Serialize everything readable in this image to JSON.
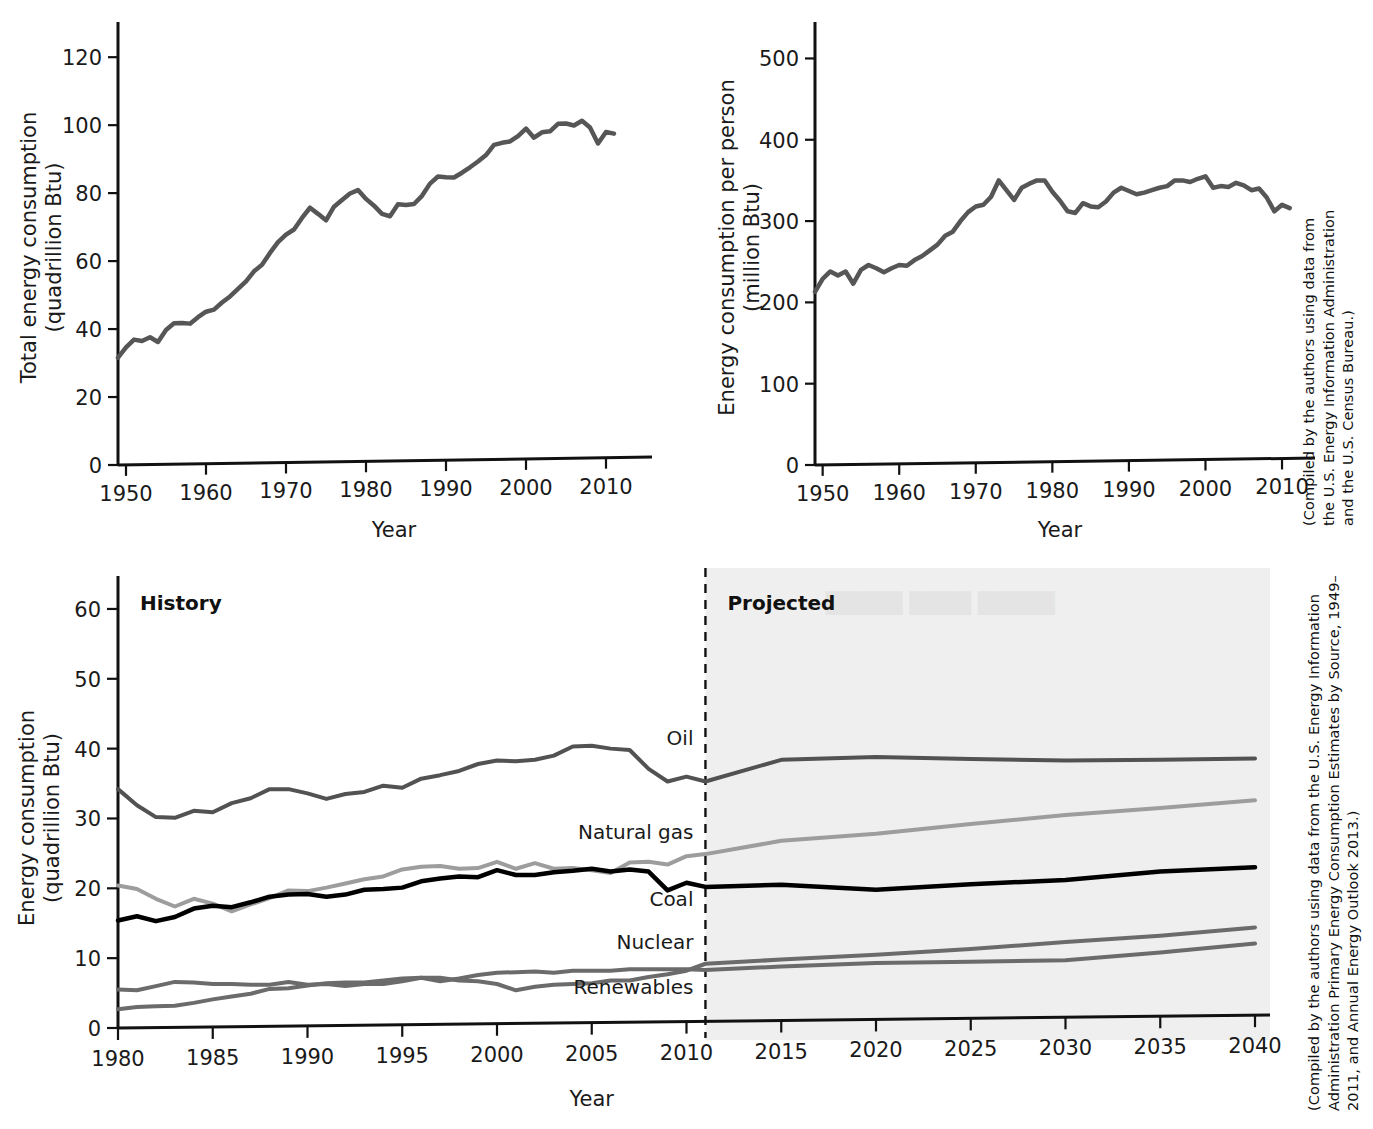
{
  "figure": {
    "background": "#ffffff",
    "line_color_dark": "#4a4a4a",
    "accent_black": "#000000"
  },
  "captions": {
    "top_right": "(Compiled by the authors using data from the U.S. Energy Information Administration and the U.S. Census Bureau.)",
    "bottom_right": "(Compiled by the authors using data from the U.S. Energy Information Administration Primary Energy Consumption Estimates by Source, 1949–2011, and Annual Energy Outlook 2013.)"
  },
  "chart_data": [
    {
      "id": "total-energy-consumption",
      "type": "line",
      "title": "",
      "xlabel": "Year",
      "ylabel": "Total energy consumption\n(quadrillion Btu)",
      "ylabel_line1": "Total energy consumption",
      "ylabel_line2": "(quadrillion Btu)",
      "xlim": [
        1949,
        2013
      ],
      "ylim": [
        0,
        128
      ],
      "xticks": [
        1950,
        1960,
        1970,
        1980,
        1990,
        2000,
        2010
      ],
      "yticks": [
        0,
        20,
        40,
        60,
        80,
        100,
        120
      ],
      "grid": false,
      "legend": "none",
      "line_color": "#565656",
      "line_width": 4.5,
      "x": [
        1949,
        1950,
        1951,
        1952,
        1953,
        1954,
        1955,
        1956,
        1957,
        1958,
        1959,
        1960,
        1961,
        1962,
        1963,
        1964,
        1965,
        1966,
        1967,
        1968,
        1969,
        1970,
        1971,
        1972,
        1973,
        1974,
        1975,
        1976,
        1977,
        1978,
        1979,
        1980,
        1981,
        1982,
        1983,
        1984,
        1985,
        1986,
        1987,
        1988,
        1989,
        1990,
        1991,
        1992,
        1993,
        1994,
        1995,
        1996,
        1997,
        1998,
        1999,
        2000,
        2001,
        2002,
        2003,
        2004,
        2005,
        2006,
        2007,
        2008,
        2009,
        2010,
        2011
      ],
      "values": [
        31.6,
        34.6,
        36.9,
        36.5,
        37.6,
        36.2,
        39.7,
        41.7,
        41.8,
        41.6,
        43.5,
        45.1,
        45.7,
        47.8,
        49.6,
        51.8,
        54.0,
        57.0,
        58.9,
        62.4,
        65.6,
        67.8,
        69.3,
        72.7,
        75.7,
        73.9,
        72.0,
        76.0,
        78.0,
        79.9,
        80.9,
        78.3,
        76.3,
        73.9,
        73.2,
        76.7,
        76.5,
        76.8,
        79.2,
        82.8,
        84.9,
        84.7,
        84.6,
        86.0,
        87.6,
        89.3,
        91.2,
        94.2,
        94.8,
        95.2,
        96.8,
        99.0,
        96.3,
        97.9,
        98.2,
        100.4,
        100.5,
        99.9,
        101.3,
        99.3,
        94.6,
        98.0,
        97.5
      ]
    },
    {
      "id": "energy-consumption-per-person",
      "type": "line",
      "title": "",
      "xlabel": "Year",
      "ylabel": "Energy consumption per person\n(million Btu)",
      "ylabel_line1": "Energy consumption per person",
      "ylabel_line2": "(million Btu)",
      "xlim": [
        1949,
        2013
      ],
      "ylim": [
        0,
        535
      ],
      "xticks": [
        1950,
        1960,
        1970,
        1980,
        1990,
        2000,
        2010
      ],
      "yticks": [
        0,
        100,
        200,
        300,
        400,
        500
      ],
      "grid": false,
      "legend": "none",
      "line_color": "#565656",
      "line_width": 4.5,
      "x": [
        1949,
        1950,
        1951,
        1952,
        1953,
        1954,
        1955,
        1956,
        1957,
        1958,
        1959,
        1960,
        1961,
        1962,
        1963,
        1964,
        1965,
        1966,
        1967,
        1968,
        1969,
        1970,
        1971,
        1972,
        1973,
        1974,
        1975,
        1976,
        1977,
        1978,
        1979,
        1980,
        1981,
        1982,
        1983,
        1984,
        1985,
        1986,
        1987,
        1988,
        1989,
        1990,
        1991,
        1992,
        1993,
        1994,
        1995,
        1996,
        1997,
        1998,
        1999,
        2000,
        2001,
        2002,
        2003,
        2004,
        2005,
        2006,
        2007,
        2008,
        2009,
        2010,
        2011
      ],
      "values": [
        213,
        229,
        238,
        233,
        238,
        223,
        240,
        246,
        242,
        237,
        242,
        246,
        245,
        252,
        257,
        264,
        271,
        282,
        287,
        300,
        311,
        318,
        320,
        330,
        350,
        338,
        326,
        341,
        346,
        350,
        350,
        336,
        325,
        312,
        310,
        322,
        318,
        317,
        324,
        335,
        341,
        337,
        333,
        335,
        338,
        341,
        343,
        350,
        350,
        348,
        352,
        355,
        341,
        343,
        342,
        347,
        344,
        338,
        340,
        329,
        312,
        320,
        316
      ]
    },
    {
      "id": "energy-consumption-by-source",
      "type": "line",
      "title": "",
      "xlabel": "Year",
      "ylabel": "Energy consumption\n(quadrillion Btu)",
      "ylabel_line1": "Energy consumption",
      "ylabel_line2": "(quadrillion Btu)",
      "xlim": [
        1980,
        2040
      ],
      "ylim": [
        0,
        63
      ],
      "xticks": [
        1980,
        1985,
        1990,
        1995,
        2000,
        2005,
        2010,
        2015,
        2020,
        2025,
        2030,
        2035,
        2040
      ],
      "yticks": [
        0,
        10,
        20,
        30,
        40,
        50,
        60
      ],
      "grid": false,
      "legend": "inline-right",
      "history_label": "History",
      "projected_label": "Projected",
      "divider_year": 2011,
      "projected_fill": "#efefef",
      "series": [
        {
          "name": "Oil",
          "color": "#525252",
          "width": 4,
          "label_x": 2011,
          "label_y": 41.5,
          "x": [
            1980,
            1981,
            1982,
            1983,
            1984,
            1985,
            1986,
            1987,
            1988,
            1989,
            1990,
            1991,
            1992,
            1993,
            1994,
            1995,
            1996,
            1997,
            1998,
            1999,
            2000,
            2001,
            2002,
            2003,
            2004,
            2005,
            2006,
            2007,
            2008,
            2009,
            2010,
            2011,
            2015,
            2020,
            2025,
            2030,
            2035,
            2040
          ],
          "values": [
            34.2,
            31.9,
            30.2,
            30.1,
            31.1,
            30.9,
            32.2,
            32.9,
            34.2,
            34.2,
            33.6,
            32.8,
            33.5,
            33.8,
            34.7,
            34.4,
            35.7,
            36.2,
            36.8,
            37.8,
            38.3,
            38.2,
            38.4,
            39.0,
            40.3,
            40.4,
            40.0,
            39.8,
            37.1,
            35.3,
            36.0,
            35.3,
            38.4,
            38.8,
            38.5,
            38.3,
            38.4,
            38.6
          ]
        },
        {
          "name": "Natural gas",
          "color": "#9d9d9d",
          "width": 4,
          "label_x": 2011,
          "label_y": 28.0,
          "x": [
            1980,
            1981,
            1982,
            1983,
            1984,
            1985,
            1986,
            1987,
            1988,
            1989,
            1990,
            1991,
            1992,
            1993,
            1994,
            1995,
            1996,
            1997,
            1998,
            1999,
            2000,
            2001,
            2002,
            2003,
            2004,
            2005,
            2006,
            2007,
            2008,
            2009,
            2010,
            2011,
            2015,
            2020,
            2025,
            2030,
            2035,
            2040
          ],
          "values": [
            20.4,
            19.9,
            18.5,
            17.4,
            18.5,
            17.8,
            16.7,
            17.7,
            18.6,
            19.7,
            19.6,
            20.1,
            20.7,
            21.3,
            21.7,
            22.7,
            23.1,
            23.2,
            22.8,
            22.9,
            23.8,
            22.8,
            23.6,
            22.8,
            22.9,
            22.6,
            22.2,
            23.7,
            23.8,
            23.4,
            24.6,
            24.9,
            26.8,
            27.8,
            29.2,
            30.5,
            31.5,
            32.6
          ]
        },
        {
          "name": "Coal",
          "color": "#000000",
          "width": 4.5,
          "label_x": 2011,
          "label_y": 18.5,
          "x": [
            1980,
            1981,
            1982,
            1983,
            1984,
            1985,
            1986,
            1987,
            1988,
            1989,
            1990,
            1991,
            1992,
            1993,
            1994,
            1995,
            1996,
            1997,
            1998,
            1999,
            2000,
            2001,
            2002,
            2003,
            2004,
            2005,
            2006,
            2007,
            2008,
            2009,
            2010,
            2011,
            2015,
            2020,
            2025,
            2030,
            2035,
            2040
          ],
          "values": [
            15.4,
            16.0,
            15.3,
            15.9,
            17.1,
            17.5,
            17.3,
            18.0,
            18.8,
            19.1,
            19.2,
            18.8,
            19.1,
            19.8,
            19.9,
            20.1,
            21.0,
            21.4,
            21.7,
            21.6,
            22.6,
            21.9,
            21.9,
            22.3,
            22.5,
            22.8,
            22.4,
            22.7,
            22.4,
            19.7,
            20.8,
            20.2,
            20.5,
            19.8,
            20.6,
            21.2,
            22.4,
            23.0
          ]
        },
        {
          "name": "Nuclear",
          "color": "#6b6b6b",
          "width": 4,
          "label_x": 2011,
          "label_y": 12.3,
          "x": [
            1980,
            1981,
            1982,
            1983,
            1984,
            1985,
            1986,
            1987,
            1988,
            1989,
            1990,
            1991,
            1992,
            1993,
            1994,
            1995,
            1996,
            1997,
            1998,
            1999,
            2000,
            2001,
            2002,
            2003,
            2004,
            2005,
            2006,
            2007,
            2008,
            2009,
            2010,
            2011,
            2015,
            2020,
            2025,
            2030,
            2035,
            2040
          ],
          "values": [
            2.7,
            3.0,
            3.1,
            3.2,
            3.6,
            4.1,
            4.5,
            4.9,
            5.6,
            5.7,
            6.1,
            6.4,
            6.5,
            6.5,
            6.8,
            7.1,
            7.2,
            6.7,
            7.1,
            7.6,
            7.9,
            8.0,
            8.1,
            7.9,
            8.2,
            8.2,
            8.2,
            8.4,
            8.4,
            8.4,
            8.4,
            8.3,
            8.8,
            9.3,
            9.5,
            9.7,
            10.8,
            12.1
          ]
        },
        {
          "name": "Renewables",
          "color": "#6b6b6b",
          "width": 4,
          "label_x": 2011,
          "label_y": 5.9,
          "x": [
            1980,
            1981,
            1982,
            1983,
            1984,
            1985,
            1986,
            1987,
            1988,
            1989,
            1990,
            1991,
            1992,
            1993,
            1994,
            1995,
            1996,
            1997,
            1998,
            1999,
            2000,
            2001,
            2002,
            2003,
            2004,
            2005,
            2006,
            2007,
            2008,
            2009,
            2010,
            2011,
            2015,
            2020,
            2025,
            2030,
            2035,
            2040
          ],
          "values": [
            5.5,
            5.4,
            6.0,
            6.6,
            6.5,
            6.3,
            6.3,
            6.2,
            6.2,
            6.6,
            6.2,
            6.3,
            6.0,
            6.3,
            6.3,
            6.7,
            7.2,
            7.2,
            6.8,
            6.7,
            6.3,
            5.4,
            5.9,
            6.2,
            6.3,
            6.4,
            6.8,
            6.8,
            7.3,
            7.7,
            8.2,
            9.2,
            9.8,
            10.5,
            11.3,
            12.3,
            13.2,
            14.4
          ]
        }
      ]
    }
  ]
}
